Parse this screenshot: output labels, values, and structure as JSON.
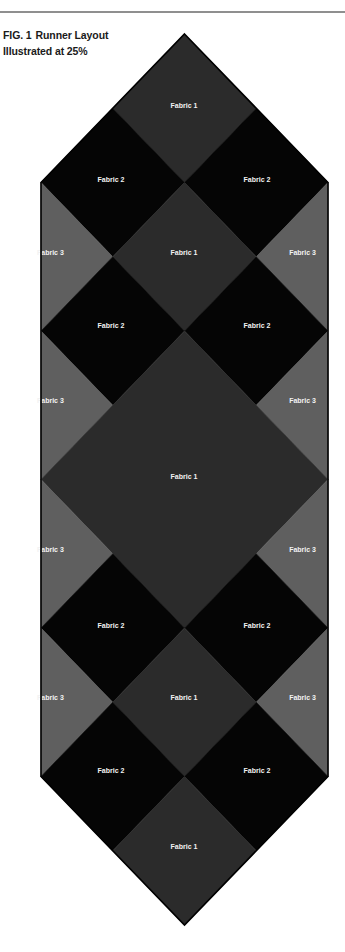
{
  "figure": {
    "number_label": "FIG. 1",
    "title": "Runner Layout",
    "subtitle": "Illustrated at 25%"
  },
  "fabrics": {
    "fabric1": {
      "name": "Fabric 1",
      "color": "#2b2b2b"
    },
    "fabric2": {
      "name": "Fabric 2",
      "color": "#050505"
    },
    "fabric3": {
      "name": "Fabric 3",
      "color": "#5f5f5f"
    }
  },
  "outline_color": "#000000",
  "rule_color": "#8f8f8f",
  "grid": {
    "x": [
      41,
      112.75,
      184.5,
      256.25,
      328
    ],
    "y": [
      34,
      108.25,
      182.5,
      256.75,
      331,
      405.25,
      479.5,
      553.75,
      628,
      702.25,
      776.5,
      850.75,
      925
    ]
  },
  "pieces": [
    {
      "id": "f1-top",
      "fabric": "fabric1",
      "pts": [
        [
          2,
          0
        ],
        [
          3,
          1
        ],
        [
          2,
          2
        ],
        [
          1,
          1
        ]
      ],
      "label": [
        184,
        106
      ]
    },
    {
      "id": "f2-r1-left",
      "fabric": "fabric2",
      "pts": [
        [
          1,
          1
        ],
        [
          2,
          2
        ],
        [
          1,
          3
        ],
        [
          0,
          2
        ]
      ],
      "label": [
        111,
        180
      ]
    },
    {
      "id": "f2-r1-right",
      "fabric": "fabric2",
      "pts": [
        [
          3,
          1
        ],
        [
          4,
          2
        ],
        [
          3,
          3
        ],
        [
          2,
          2
        ]
      ],
      "label": [
        257,
        180
      ]
    },
    {
      "id": "f3-r1-left",
      "fabric": "fabric3",
      "pts": [
        [
          0,
          2
        ],
        [
          1,
          3
        ],
        [
          0,
          4
        ]
      ],
      "label": [
        37,
        253
      ],
      "anchor": "start"
    },
    {
      "id": "f1-r2",
      "fabric": "fabric1",
      "pts": [
        [
          2,
          2
        ],
        [
          3,
          3
        ],
        [
          2,
          4
        ],
        [
          1,
          3
        ]
      ],
      "label": [
        184,
        253
      ]
    },
    {
      "id": "f3-r1-right",
      "fabric": "fabric3",
      "pts": [
        [
          4,
          2
        ],
        [
          4,
          4
        ],
        [
          3,
          3
        ]
      ],
      "label": [
        316,
        253
      ],
      "anchor": "end"
    },
    {
      "id": "f2-r2-left",
      "fabric": "fabric2",
      "pts": [
        [
          1,
          3
        ],
        [
          2,
          4
        ],
        [
          1,
          5
        ],
        [
          0,
          4
        ]
      ],
      "label": [
        111,
        326
      ]
    },
    {
      "id": "f2-r2-right",
      "fabric": "fabric2",
      "pts": [
        [
          3,
          3
        ],
        [
          4,
          4
        ],
        [
          3,
          5
        ],
        [
          2,
          4
        ]
      ],
      "label": [
        257,
        326
      ]
    },
    {
      "id": "f3-r2-left",
      "fabric": "fabric3",
      "pts": [
        [
          0,
          4
        ],
        [
          1,
          5
        ],
        [
          0,
          6
        ]
      ],
      "label": [
        37,
        401
      ],
      "anchor": "start"
    },
    {
      "id": "f3-r2-right",
      "fabric": "fabric3",
      "pts": [
        [
          4,
          4
        ],
        [
          4,
          6
        ],
        [
          3,
          5
        ]
      ],
      "label": [
        316,
        401
      ],
      "anchor": "end"
    },
    {
      "id": "f1-center",
      "fabric": "fabric1",
      "pts": [
        [
          2,
          4
        ],
        [
          4,
          6
        ],
        [
          2,
          8
        ],
        [
          0,
          6
        ]
      ],
      "label": [
        184,
        477
      ]
    },
    {
      "id": "f3-r3-left",
      "fabric": "fabric3",
      "pts": [
        [
          0,
          6
        ],
        [
          1,
          7
        ],
        [
          0,
          8
        ]
      ],
      "label": [
        37,
        550
      ],
      "anchor": "start"
    },
    {
      "id": "f3-r3-right",
      "fabric": "fabric3",
      "pts": [
        [
          4,
          6
        ],
        [
          4,
          8
        ],
        [
          3,
          7
        ]
      ],
      "label": [
        316,
        550
      ],
      "anchor": "end"
    },
    {
      "id": "f2-r3-left",
      "fabric": "fabric2",
      "pts": [
        [
          1,
          7
        ],
        [
          2,
          8
        ],
        [
          1,
          9
        ],
        [
          0,
          8
        ]
      ],
      "label": [
        111,
        626
      ]
    },
    {
      "id": "f2-r3-right",
      "fabric": "fabric2",
      "pts": [
        [
          3,
          7
        ],
        [
          4,
          8
        ],
        [
          3,
          9
        ],
        [
          2,
          8
        ]
      ],
      "label": [
        257,
        626
      ]
    },
    {
      "id": "f3-r4-left",
      "fabric": "fabric3",
      "pts": [
        [
          0,
          8
        ],
        [
          1,
          9
        ],
        [
          0,
          10
        ]
      ],
      "label": [
        37,
        698
      ],
      "anchor": "start"
    },
    {
      "id": "f1-r4",
      "fabric": "fabric1",
      "pts": [
        [
          2,
          8
        ],
        [
          3,
          9
        ],
        [
          2,
          10
        ],
        [
          1,
          9
        ]
      ],
      "label": [
        184,
        698
      ]
    },
    {
      "id": "f3-r4-right",
      "fabric": "fabric3",
      "pts": [
        [
          4,
          8
        ],
        [
          4,
          10
        ],
        [
          3,
          9
        ]
      ],
      "label": [
        316,
        698
      ],
      "anchor": "end"
    },
    {
      "id": "f2-r4-left",
      "fabric": "fabric2",
      "pts": [
        [
          1,
          9
        ],
        [
          2,
          10
        ],
        [
          1,
          11
        ],
        [
          0,
          10
        ]
      ],
      "label": [
        111,
        771
      ]
    },
    {
      "id": "f2-r4-right",
      "fabric": "fabric2",
      "pts": [
        [
          3,
          9
        ],
        [
          4,
          10
        ],
        [
          3,
          11
        ],
        [
          2,
          10
        ]
      ],
      "label": [
        257,
        771
      ]
    },
    {
      "id": "f1-bottom",
      "fabric": "fabric1",
      "pts": [
        [
          2,
          10
        ],
        [
          3,
          11
        ],
        [
          2,
          12
        ],
        [
          1,
          11
        ]
      ],
      "label": [
        184,
        847
      ]
    }
  ],
  "outline": [
    [
      2,
      0
    ],
    [
      4,
      2
    ],
    [
      4,
      10
    ],
    [
      2,
      12
    ],
    [
      0,
      10
    ],
    [
      0,
      2
    ]
  ]
}
